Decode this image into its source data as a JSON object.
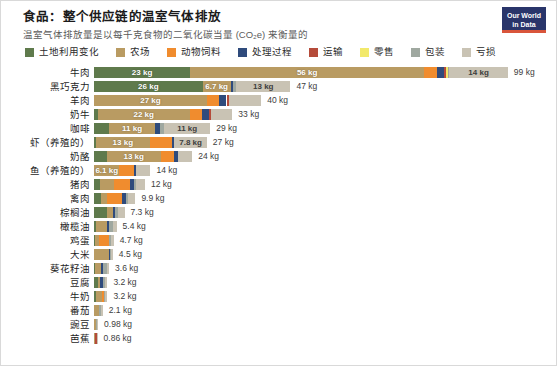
{
  "header": {
    "title": "食品：整个供应链的温室气体排放",
    "subtitle": "温室气体排放量是以每千克食物的二氧化碳当量 (CO₂e) 来衡量的",
    "logo_line1": "Our World",
    "logo_line2": "in Data"
  },
  "legend": [
    {
      "label": "土地利用变化",
      "color": "#5f7a4c"
    },
    {
      "label": "农场",
      "color": "#b99b62"
    },
    {
      "label": "动物饲料",
      "color": "#f08c2e"
    },
    {
      "label": "处理过程",
      "color": "#2f4b7c"
    },
    {
      "label": "运输",
      "color": "#b54b3a"
    },
    {
      "label": "零售",
      "color": "#f2e96b"
    },
    {
      "label": "包装",
      "color": "#9fa8a0"
    },
    {
      "label": "亏损",
      "color": "#c9c3b4"
    }
  ],
  "chart_data": {
    "type": "bar",
    "subtype": "horizontal-stacked",
    "title": "食品：整个供应链的温室气体排放",
    "subtitle": "温室气体排放量是以每千克食物的二氧化碳当量 (CO₂e) 来衡量的",
    "xlabel": "",
    "ylabel": "",
    "unit": "kg",
    "xlim": [
      0,
      99
    ],
    "grid": false,
    "legend_position": "top",
    "series": [
      {
        "name": "土地利用变化",
        "color": "#5f7a4c"
      },
      {
        "name": "农场",
        "color": "#b99b62"
      },
      {
        "name": "动物饲料",
        "color": "#f08c2e"
      },
      {
        "name": "处理过程",
        "color": "#2f4b7c"
      },
      {
        "name": "运输",
        "color": "#b54b3a"
      },
      {
        "name": "零售",
        "color": "#f2e96b"
      },
      {
        "name": "包装",
        "color": "#9fa8a0"
      },
      {
        "name": "亏损",
        "color": "#c9c3b4"
      }
    ],
    "categories": [
      "牛肉",
      "黑巧克力",
      "羊肉",
      "奶牛",
      "咖啡",
      "虾（养殖的）",
      "奶酪",
      "鱼（养殖的）",
      "猪肉",
      "禽肉",
      "棕榈油",
      "橄榄油",
      "鸡蛋",
      "大米",
      "葵花籽油",
      "豆腐",
      "牛奶",
      "番茄",
      "豌豆",
      "芭蕉"
    ],
    "rows": [
      {
        "label": "牛肉",
        "total": 99,
        "total_text": "99 kg",
        "segments": [
          {
            "series": "土地利用变化",
            "value": 23,
            "text": "23 kg",
            "show_label": true
          },
          {
            "series": "农场",
            "value": 56,
            "text": "56 kg",
            "show_label": true
          },
          {
            "series": "动物饲料",
            "value": 3.0,
            "text": "",
            "show_label": false
          },
          {
            "series": "处理过程",
            "value": 1.8,
            "text": "",
            "show_label": false
          },
          {
            "series": "运输",
            "value": 0.5,
            "text": "",
            "show_label": false
          },
          {
            "series": "零售",
            "value": 0.3,
            "text": "",
            "show_label": false
          },
          {
            "series": "包装",
            "value": 0.4,
            "text": "",
            "show_label": false
          },
          {
            "series": "亏损",
            "value": 14,
            "text": "14 kg",
            "show_label": true
          }
        ]
      },
      {
        "label": "黑巧克力",
        "total": 47,
        "total_text": "47 kg",
        "segments": [
          {
            "series": "土地利用变化",
            "value": 26,
            "text": "26 kg",
            "show_label": true
          },
          {
            "series": "农场",
            "value": 6.7,
            "text": "6.7 kg",
            "show_label": true
          },
          {
            "series": "处理过程",
            "value": 0.5,
            "text": "",
            "show_label": false
          },
          {
            "series": "包装",
            "value": 0.8,
            "text": "",
            "show_label": false
          },
          {
            "series": "亏损",
            "value": 13,
            "text": "13 kg",
            "show_label": true
          }
        ]
      },
      {
        "label": "羊肉",
        "total": 40,
        "total_text": "40 kg",
        "segments": [
          {
            "series": "农场",
            "value": 27,
            "text": "27 kg",
            "show_label": true
          },
          {
            "series": "动物饲料",
            "value": 3.0,
            "text": "",
            "show_label": false
          },
          {
            "series": "处理过程",
            "value": 1.7,
            "text": "",
            "show_label": false
          },
          {
            "series": "运输",
            "value": 0.5,
            "text": "",
            "show_label": false
          },
          {
            "series": "亏损",
            "value": 7.8,
            "text": "",
            "show_label": false
          }
        ]
      },
      {
        "label": "奶牛",
        "total": 33,
        "total_text": "33 kg",
        "segments": [
          {
            "series": "土地利用变化",
            "value": 0.9,
            "text": "",
            "show_label": false
          },
          {
            "series": "农场",
            "value": 22,
            "text": "22 kg",
            "show_label": true
          },
          {
            "series": "动物饲料",
            "value": 3.0,
            "text": "",
            "show_label": false
          },
          {
            "series": "处理过程",
            "value": 1.7,
            "text": "",
            "show_label": false
          },
          {
            "series": "运输",
            "value": 0.5,
            "text": "",
            "show_label": false
          },
          {
            "series": "亏损",
            "value": 5.0,
            "text": "",
            "show_label": false
          }
        ]
      },
      {
        "label": "咖啡",
        "total": 29,
        "total_text": "29 kg",
        "segments": [
          {
            "series": "土地利用变化",
            "value": 3.6,
            "text": "",
            "show_label": false
          },
          {
            "series": "农场",
            "value": 11,
            "text": "11 kg",
            "show_label": true
          },
          {
            "series": "处理过程",
            "value": 1.2,
            "text": "",
            "show_label": false
          },
          {
            "series": "包装",
            "value": 1.0,
            "text": "",
            "show_label": false
          },
          {
            "series": "亏损",
            "value": 11,
            "text": "11 kg",
            "show_label": true
          }
        ]
      },
      {
        "label": "虾（养殖的）",
        "total": 27,
        "total_text": "27 kg",
        "segments": [
          {
            "series": "土地利用变化",
            "value": 0.4,
            "text": "",
            "show_label": false
          },
          {
            "series": "农场",
            "value": 13,
            "text": "13 kg",
            "show_label": true
          },
          {
            "series": "动物饲料",
            "value": 5.2,
            "text": "",
            "show_label": false
          },
          {
            "series": "处理过程",
            "value": 0.6,
            "text": "",
            "show_label": false
          },
          {
            "series": "亏损",
            "value": 7.8,
            "text": "7.8 kg",
            "show_label": true
          }
        ]
      },
      {
        "label": "奶酪",
        "total": 24,
        "total_text": "24 kg",
        "segments": [
          {
            "series": "土地利用变化",
            "value": 3.0,
            "text": "",
            "show_label": false
          },
          {
            "series": "农场",
            "value": 13,
            "text": "13 kg",
            "show_label": true
          },
          {
            "series": "动物饲料",
            "value": 3.2,
            "text": "",
            "show_label": false
          },
          {
            "series": "处理过程",
            "value": 0.8,
            "text": "",
            "show_label": false
          },
          {
            "series": "亏损",
            "value": 3.5,
            "text": "",
            "show_label": false
          }
        ]
      },
      {
        "label": "鱼（养殖的）",
        "total": 14,
        "total_text": "14 kg",
        "segments": [
          {
            "series": "农场",
            "value": 6.1,
            "text": "6.1 kg",
            "show_label": true
          },
          {
            "series": "动物饲料",
            "value": 3.4,
            "text": "",
            "show_label": false
          },
          {
            "series": "处理过程",
            "value": 0.5,
            "text": "",
            "show_label": false
          },
          {
            "series": "亏损",
            "value": 3.5,
            "text": "",
            "show_label": false
          }
        ]
      },
      {
        "label": "猪肉",
        "total": 12,
        "total_text": "12 kg",
        "segments": [
          {
            "series": "土地利用变化",
            "value": 1.5,
            "text": "",
            "show_label": false
          },
          {
            "series": "农场",
            "value": 3.4,
            "text": "",
            "show_label": false
          },
          {
            "series": "动物饲料",
            "value": 3.8,
            "text": "",
            "show_label": false
          },
          {
            "series": "处理过程",
            "value": 0.8,
            "text": "",
            "show_label": false
          },
          {
            "series": "包装",
            "value": 0.5,
            "text": "",
            "show_label": false
          },
          {
            "series": "亏损",
            "value": 2.2,
            "text": "",
            "show_label": false
          }
        ]
      },
      {
        "label": "禽肉",
        "total": 9.9,
        "total_text": "9.9 kg",
        "segments": [
          {
            "series": "土地利用变化",
            "value": 1.6,
            "text": "",
            "show_label": false
          },
          {
            "series": "农场",
            "value": 1.6,
            "text": "",
            "show_label": false
          },
          {
            "series": "动物饲料",
            "value": 3.6,
            "text": "",
            "show_label": false
          },
          {
            "series": "处理过程",
            "value": 0.8,
            "text": "",
            "show_label": false
          },
          {
            "series": "包装",
            "value": 0.5,
            "text": "",
            "show_label": false
          },
          {
            "series": "亏损",
            "value": 1.8,
            "text": "",
            "show_label": false
          }
        ]
      },
      {
        "label": "棕榈油",
        "total": 7.3,
        "total_text": "7.3 kg",
        "segments": [
          {
            "series": "土地利用变化",
            "value": 3.1,
            "text": "",
            "show_label": false
          },
          {
            "series": "农场",
            "value": 1.4,
            "text": "",
            "show_label": false
          },
          {
            "series": "处理过程",
            "value": 0.6,
            "text": "",
            "show_label": false
          },
          {
            "series": "包装",
            "value": 0.7,
            "text": "",
            "show_label": false
          },
          {
            "series": "亏损",
            "value": 1.5,
            "text": "",
            "show_label": false
          }
        ]
      },
      {
        "label": "橄榄油",
        "total": 5.4,
        "total_text": "5.4 kg",
        "segments": [
          {
            "series": "土地利用变化",
            "value": 0.4,
            "text": "",
            "show_label": false
          },
          {
            "series": "农场",
            "value": 2.8,
            "text": "",
            "show_label": false
          },
          {
            "series": "处理过程",
            "value": 0.5,
            "text": "",
            "show_label": false
          },
          {
            "series": "包装",
            "value": 0.9,
            "text": "",
            "show_label": false
          },
          {
            "series": "亏损",
            "value": 0.8,
            "text": "",
            "show_label": false
          }
        ]
      },
      {
        "label": "鸡蛋",
        "total": 4.7,
        "total_text": "4.7 kg",
        "segments": [
          {
            "series": "土地利用变化",
            "value": 0.2,
            "text": "",
            "show_label": false
          },
          {
            "series": "农场",
            "value": 0.9,
            "text": "",
            "show_label": false
          },
          {
            "series": "动物饲料",
            "value": 2.6,
            "text": "",
            "show_label": false
          },
          {
            "series": "包装",
            "value": 0.3,
            "text": "",
            "show_label": false
          },
          {
            "series": "亏损",
            "value": 0.7,
            "text": "",
            "show_label": false
          }
        ]
      },
      {
        "label": "大米",
        "total": 4.5,
        "total_text": "4.5 kg",
        "segments": [
          {
            "series": "农场",
            "value": 3.6,
            "text": "",
            "show_label": false
          },
          {
            "series": "处理过程",
            "value": 0.2,
            "text": "",
            "show_label": false
          },
          {
            "series": "包装",
            "value": 0.2,
            "text": "",
            "show_label": false
          },
          {
            "series": "亏损",
            "value": 0.5,
            "text": "",
            "show_label": false
          }
        ]
      },
      {
        "label": "葵花籽油",
        "total": 3.6,
        "total_text": "3.6 kg",
        "segments": [
          {
            "series": "土地利用变化",
            "value": 0.2,
            "text": "",
            "show_label": false
          },
          {
            "series": "农场",
            "value": 1.4,
            "text": "",
            "show_label": false
          },
          {
            "series": "处理过程",
            "value": 0.6,
            "text": "",
            "show_label": false
          },
          {
            "series": "包装",
            "value": 0.8,
            "text": "",
            "show_label": false
          },
          {
            "series": "亏损",
            "value": 0.6,
            "text": "",
            "show_label": false
          }
        ]
      },
      {
        "label": "豆腐",
        "total": 3.2,
        "total_text": "3.2 kg",
        "segments": [
          {
            "series": "土地利用变化",
            "value": 0.9,
            "text": "",
            "show_label": false
          },
          {
            "series": "农场",
            "value": 0.6,
            "text": "",
            "show_label": false
          },
          {
            "series": "处理过程",
            "value": 0.7,
            "text": "",
            "show_label": false
          },
          {
            "series": "包装",
            "value": 0.5,
            "text": "",
            "show_label": false
          },
          {
            "series": "亏损",
            "value": 0.5,
            "text": "",
            "show_label": false
          }
        ]
      },
      {
        "label": "牛奶",
        "total": 3.2,
        "total_text": "3.2 kg",
        "segments": [
          {
            "series": "土地利用变化",
            "value": 0.4,
            "text": "",
            "show_label": false
          },
          {
            "series": "农场",
            "value": 1.6,
            "text": "",
            "show_label": false
          },
          {
            "series": "动物饲料",
            "value": 0.4,
            "text": "",
            "show_label": false
          },
          {
            "series": "包装",
            "value": 0.3,
            "text": "",
            "show_label": false
          },
          {
            "series": "亏损",
            "value": 0.5,
            "text": "",
            "show_label": false
          }
        ]
      },
      {
        "label": "番茄",
        "total": 2.1,
        "total_text": "2.1 kg",
        "segments": [
          {
            "series": "农场",
            "value": 1.1,
            "text": "",
            "show_label": false
          },
          {
            "series": "处理过程",
            "value": 0.2,
            "text": "",
            "show_label": false
          },
          {
            "series": "包装",
            "value": 0.4,
            "text": "",
            "show_label": false
          },
          {
            "series": "亏损",
            "value": 0.4,
            "text": "",
            "show_label": false
          }
        ]
      },
      {
        "label": "豌豆",
        "total": 0.98,
        "total_text": "0.98 kg",
        "segments": [
          {
            "series": "农场",
            "value": 0.55,
            "text": "",
            "show_label": false
          },
          {
            "series": "包装",
            "value": 0.18,
            "text": "",
            "show_label": false
          },
          {
            "series": "亏损",
            "value": 0.25,
            "text": "",
            "show_label": false
          }
        ]
      },
      {
        "label": "芭蕉",
        "total": 0.86,
        "total_text": "0.86 kg",
        "segments": [
          {
            "series": "农场",
            "value": 0.34,
            "text": "",
            "show_label": false
          },
          {
            "series": "运输",
            "value": 0.3,
            "text": "",
            "show_label": false
          },
          {
            "series": "亏损",
            "value": 0.22,
            "text": "",
            "show_label": false
          }
        ]
      }
    ]
  }
}
